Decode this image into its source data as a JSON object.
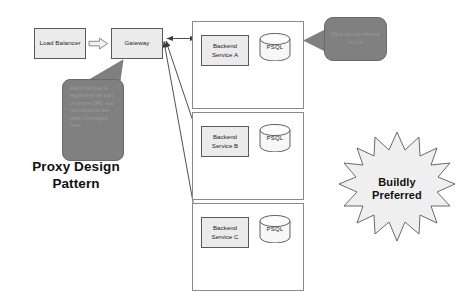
{
  "title": "Proxy Design Pattern",
  "colors": {
    "node_fill": "#ebebeb",
    "node_stroke": "#5a5a5a",
    "container_stroke": "#8a8a8a",
    "callout_fill": "#808080",
    "callout_text": "#9b9b9b",
    "starburst_fill": "#efefef",
    "background": "#ffffff",
    "text": "#1d1d1d"
  },
  "nodes": {
    "load_balancer": "Load Balancer",
    "gateway": "Gateway"
  },
  "services": [
    {
      "name": "Backend Service A",
      "database": "PSQL"
    },
    {
      "name": "Backend Service B",
      "database": "PSQL"
    },
    {
      "name": "Backend Service C",
      "database": "PSQL"
    }
  ],
  "callouts": {
    "gateway_note": "Each service is registered as part of single URL and permissions are often managed here",
    "data_note": "Data can be shared or not"
  },
  "badge": {
    "line1": "Buildly",
    "line2": "Preferred"
  },
  "connectors": {
    "lb_to_gateway": "block-arrow-right",
    "gateway_to_service_a": "double-arrow",
    "gateway_to_service_b": "double-arrow",
    "gateway_to_service_c": "double-arrow",
    "data_note_to_service_a": "callout-tail-left"
  }
}
